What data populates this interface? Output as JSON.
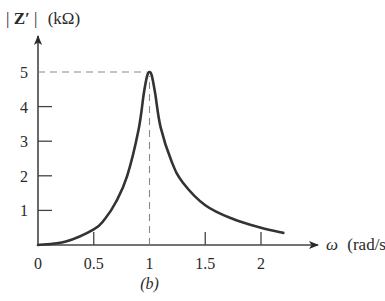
{
  "chart_data": {
    "type": "line",
    "title": "",
    "caption": "(b)",
    "ylabel": "|Z′| (kΩ)",
    "ylabel_parts": {
      "bar_left": "|",
      "symbol": "Z′",
      "bar_right": "|",
      "unit": "(kΩ)"
    },
    "xlabel": "ω (rad/s",
    "xlabel_parts": {
      "symbol": "ω",
      "unit": "(rad/s"
    },
    "xlim": [
      0,
      2.45
    ],
    "ylim": [
      0,
      5.9
    ],
    "x_ticks": [
      0,
      0.5,
      1,
      1.5,
      2
    ],
    "x_tick_labels": [
      "0",
      "0.5",
      "1",
      "1.5",
      "2"
    ],
    "y_ticks": [
      1,
      2,
      3,
      4,
      5
    ],
    "y_tick_labels": [
      "1",
      "2",
      "3",
      "4",
      "5"
    ],
    "grid": false,
    "legend": "none",
    "annotations": [
      {
        "type": "dashed-guide",
        "description": "horizontal dashed line from y-axis at |Z′|=5 to the peak",
        "y": 5,
        "x_from": 0,
        "x_to": 1
      },
      {
        "type": "dashed-guide",
        "description": "vertical dashed line from peak down to ω=1",
        "x": 1,
        "y_from": 0,
        "y_to": 5
      }
    ],
    "series": [
      {
        "name": "|Z′|",
        "color": "#333333",
        "x": [
          0,
          0.25,
          0.5,
          0.6,
          0.7,
          0.8,
          0.9,
          0.95,
          0.98,
          1.0,
          1.02,
          1.05,
          1.1,
          1.2,
          1.3,
          1.5,
          1.75,
          2.0,
          2.2
        ],
        "y": [
          0,
          0.1,
          0.45,
          0.75,
          1.25,
          2.0,
          3.3,
          4.4,
          4.9,
          5.0,
          4.9,
          4.4,
          3.4,
          2.4,
          1.8,
          1.15,
          0.75,
          0.5,
          0.35
        ]
      }
    ]
  }
}
